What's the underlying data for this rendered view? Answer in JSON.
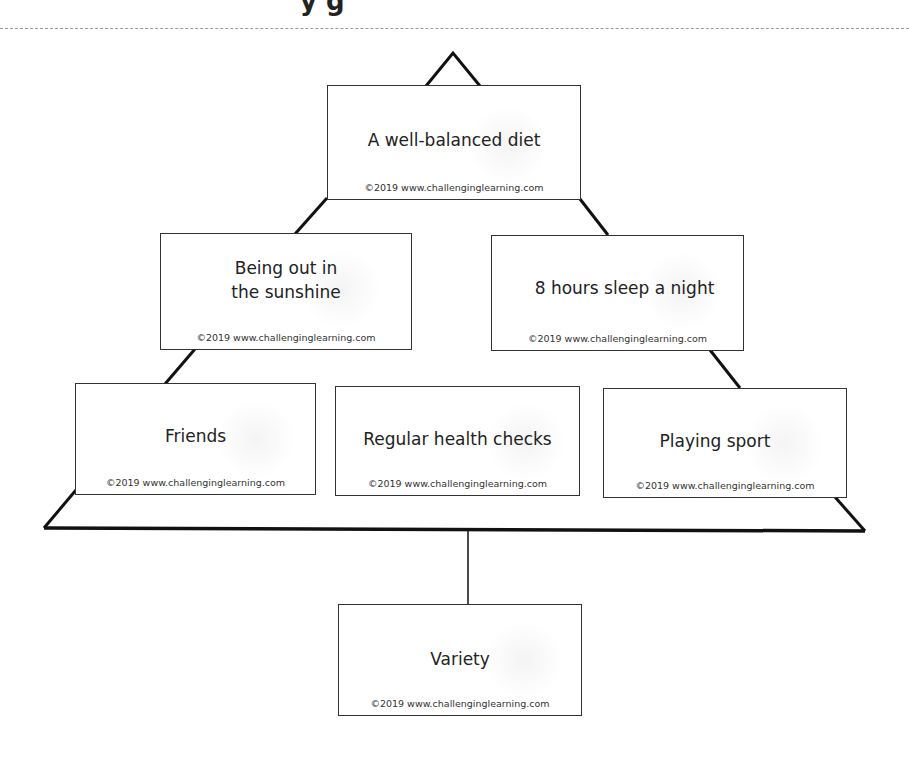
{
  "header": {
    "title_fragment": "y      g"
  },
  "diagram": {
    "type": "diamond-ranking / pyramid ranking",
    "copyright": "©2019 www.challenginglearning.com",
    "cards": [
      {
        "id": "top",
        "label": "A well-balanced diet"
      },
      {
        "id": "mid-left",
        "label": "Being out in the sunshine",
        "line1": "Being out in",
        "line2": "the sunshine"
      },
      {
        "id": "mid-right",
        "label": "8 hours sleep a night"
      },
      {
        "id": "low-left",
        "label": "Friends"
      },
      {
        "id": "low-center",
        "label": "Regular health checks"
      },
      {
        "id": "low-right",
        "label": "Playing sport"
      },
      {
        "id": "bottom",
        "label": "Variety"
      }
    ]
  },
  "colors": {
    "line": "#111111",
    "card_border": "#333333",
    "dash": "#9a9a9a",
    "background": "#ffffff"
  }
}
